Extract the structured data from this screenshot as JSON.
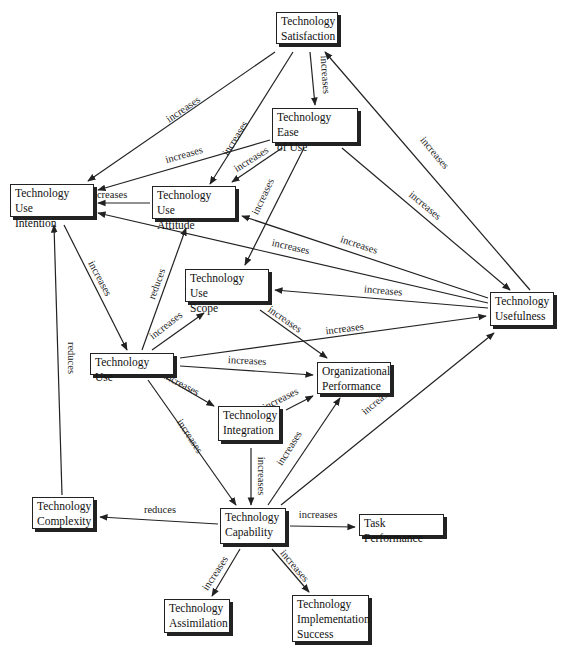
{
  "diagram": {
    "type": "concept-map",
    "nodes": [
      {
        "id": "satisfaction",
        "label": "Technology\nSatisfaction",
        "x": 276,
        "y": 12,
        "w": 62,
        "h": 32
      },
      {
        "id": "ease_of_use",
        "label": "Technology Ease\nof Use",
        "x": 272,
        "y": 108,
        "w": 86,
        "h": 35
      },
      {
        "id": "use_intention",
        "label": "Technology Use\nIntention",
        "x": 10,
        "y": 184,
        "w": 84,
        "h": 33
      },
      {
        "id": "use_attitude",
        "label": "Technology Use\nAttitude",
        "x": 152,
        "y": 186,
        "w": 84,
        "h": 33
      },
      {
        "id": "use_scope",
        "label": "Technology Use\nScope",
        "x": 185,
        "y": 269,
        "w": 84,
        "h": 33
      },
      {
        "id": "usefulness",
        "label": "Technology\nUsefulness",
        "x": 490,
        "y": 292,
        "w": 64,
        "h": 34
      },
      {
        "id": "tech_use",
        "label": "Technology Use",
        "x": 90,
        "y": 353,
        "w": 84,
        "h": 22
      },
      {
        "id": "org_performance",
        "label": "Organizational\nPerformance",
        "x": 317,
        "y": 362,
        "w": 74,
        "h": 32
      },
      {
        "id": "integration",
        "label": "Technology\nIntegration",
        "x": 218,
        "y": 406,
        "w": 62,
        "h": 35
      },
      {
        "id": "complexity",
        "label": "Technology\nComplexity",
        "x": 32,
        "y": 497,
        "w": 62,
        "h": 32
      },
      {
        "id": "capability",
        "label": "Technology\nCapability",
        "x": 220,
        "y": 508,
        "w": 66,
        "h": 36
      },
      {
        "id": "task_performance",
        "label": "Task Performance",
        "x": 359,
        "y": 514,
        "w": 85,
        "h": 22
      },
      {
        "id": "assimilation",
        "label": "Technology\nAssimilation",
        "x": 164,
        "y": 599,
        "w": 66,
        "h": 34
      },
      {
        "id": "impl_success",
        "label": "Technology\nImplementation\nSuccess",
        "x": 292,
        "y": 595,
        "w": 77,
        "h": 47
      }
    ],
    "edges": [
      {
        "from": "satisfaction",
        "to": "use_intention",
        "label": "increases",
        "x1": 275,
        "y1": 52,
        "x2": 88,
        "y2": 181,
        "lx": 185,
        "ly": 112,
        "rot": -34
      },
      {
        "from": "satisfaction",
        "to": "use_attitude",
        "label": "increases",
        "x1": 293,
        "y1": 52,
        "x2": 210,
        "y2": 184,
        "lx": 238,
        "ly": 140,
        "rot": -58
      },
      {
        "from": "satisfaction",
        "to": "ease_of_use",
        "label": "increases",
        "x1": 310,
        "y1": 52,
        "x2": 315,
        "y2": 105,
        "lx": 322,
        "ly": 75,
        "rot": 86
      },
      {
        "from": "usefulness",
        "to": "satisfaction",
        "label": "increases",
        "x1": 530,
        "y1": 290,
        "x2": 325,
        "y2": 52,
        "lx": 432,
        "ly": 155,
        "rot": 50
      },
      {
        "from": "ease_of_use",
        "to": "use_intention",
        "label": "increases",
        "x1": 270,
        "y1": 140,
        "x2": 98,
        "y2": 190,
        "lx": 185,
        "ly": 158,
        "rot": -16
      },
      {
        "from": "ease_of_use",
        "to": "use_attitude",
        "label": "increases",
        "x1": 282,
        "y1": 148,
        "x2": 232,
        "y2": 182,
        "lx": 253,
        "ly": 162,
        "rot": -32
      },
      {
        "from": "ease_of_use",
        "to": "use_scope",
        "label": "increases",
        "x1": 304,
        "y1": 148,
        "x2": 245,
        "y2": 265,
        "lx": 266,
        "ly": 198,
        "rot": -65
      },
      {
        "from": "ease_of_use",
        "to": "usefulness",
        "label": "increases",
        "x1": 342,
        "y1": 148,
        "x2": 510,
        "y2": 290,
        "lx": 423,
        "ly": 208,
        "rot": 40
      },
      {
        "from": "usefulness",
        "to": "use_attitude",
        "label": "increases",
        "x1": 488,
        "y1": 298,
        "x2": 242,
        "y2": 216,
        "lx": 358,
        "ly": 248,
        "rot": 18
      },
      {
        "from": "use_attitude",
        "to": "use_intention",
        "label": "increases",
        "x1": 150,
        "y1": 203,
        "x2": 98,
        "y2": 203,
        "lx": 108,
        "ly": 198,
        "rot": 0
      },
      {
        "from": "usefulness",
        "to": "use_intention",
        "label": "increases",
        "x1": 488,
        "y1": 303,
        "x2": 98,
        "y2": 213,
        "lx": 290,
        "ly": 250,
        "rot": 13
      },
      {
        "from": "usefulness",
        "to": "use_scope",
        "label": "increases",
        "x1": 488,
        "y1": 308,
        "x2": 275,
        "y2": 290,
        "lx": 383,
        "ly": 294,
        "rot": 5
      },
      {
        "from": "use_intention",
        "to": "tech_use",
        "label": "increases",
        "x1": 64,
        "y1": 225,
        "x2": 127,
        "y2": 350,
        "lx": 97,
        "ly": 280,
        "rot": 62
      },
      {
        "from": "tech_use",
        "to": "use_attitude",
        "label": "reduces",
        "x1": 142,
        "y1": 350,
        "x2": 186,
        "y2": 228,
        "lx": 160,
        "ly": 285,
        "rot": -70
      },
      {
        "from": "tech_use",
        "to": "use_scope",
        "label": "increases",
        "x1": 152,
        "y1": 350,
        "x2": 204,
        "y2": 313,
        "lx": 168,
        "ly": 328,
        "rot": -38
      },
      {
        "from": "tech_use",
        "to": "usefulness",
        "label": "increases",
        "x1": 180,
        "y1": 358,
        "x2": 486,
        "y2": 316,
        "lx": 345,
        "ly": 332,
        "rot": -7
      },
      {
        "from": "use_scope",
        "to": "org_performance",
        "label": "increases",
        "x1": 260,
        "y1": 310,
        "x2": 327,
        "y2": 358,
        "lx": 283,
        "ly": 322,
        "rot": 35
      },
      {
        "from": "tech_use",
        "to": "org_performance",
        "label": "increases",
        "x1": 180,
        "y1": 366,
        "x2": 313,
        "y2": 375,
        "lx": 247,
        "ly": 364,
        "rot": 3
      },
      {
        "from": "tech_use",
        "to": "integration",
        "label": "increases",
        "x1": 166,
        "y1": 378,
        "x2": 214,
        "y2": 406,
        "lx": 180,
        "ly": 387,
        "rot": 28
      },
      {
        "from": "integration",
        "to": "org_performance",
        "label": "increases",
        "x1": 286,
        "y1": 410,
        "x2": 313,
        "y2": 396,
        "lx": 282,
        "ly": 402,
        "rot": -27
      },
      {
        "from": "tech_use",
        "to": "capability",
        "label": "increases",
        "x1": 148,
        "y1": 380,
        "x2": 236,
        "y2": 505,
        "lx": 187,
        "ly": 438,
        "rot": 57
      },
      {
        "from": "integration",
        "to": "capability",
        "label": "increases",
        "x1": 251,
        "y1": 448,
        "x2": 251,
        "y2": 505,
        "lx": 258,
        "ly": 476,
        "rot": 90
      },
      {
        "from": "capability",
        "to": "org_performance",
        "label": "increases",
        "x1": 268,
        "y1": 505,
        "x2": 340,
        "y2": 398,
        "lx": 292,
        "ly": 450,
        "rot": -58
      },
      {
        "from": "capability",
        "to": "usefulness",
        "label": "increases",
        "x1": 281,
        "y1": 505,
        "x2": 494,
        "y2": 333,
        "lx": 380,
        "ly": 403,
        "rot": -40
      },
      {
        "from": "capability",
        "to": "complexity",
        "label": "reduces",
        "x1": 218,
        "y1": 524,
        "x2": 100,
        "y2": 517,
        "lx": 160,
        "ly": 513,
        "rot": 0
      },
      {
        "from": "complexity",
        "to": "use_intention",
        "label": "reduces",
        "x1": 62,
        "y1": 495,
        "x2": 54,
        "y2": 225,
        "lx": 68,
        "ly": 358,
        "rot": 90
      },
      {
        "from": "capability",
        "to": "task_performance",
        "label": "increases",
        "x1": 290,
        "y1": 526,
        "x2": 355,
        "y2": 527,
        "lx": 318,
        "ly": 518,
        "rot": 0
      },
      {
        "from": "capability",
        "to": "assimilation",
        "label": "increases",
        "x1": 240,
        "y1": 549,
        "x2": 212,
        "y2": 596,
        "lx": 218,
        "ly": 575,
        "rot": -57
      },
      {
        "from": "capability",
        "to": "impl_success",
        "label": "increases",
        "x1": 272,
        "y1": 549,
        "x2": 309,
        "y2": 592,
        "lx": 292,
        "ly": 568,
        "rot": 50
      }
    ]
  },
  "colors": {
    "line": "#222222",
    "box_border": "#222222",
    "box_shadow": "#222222",
    "background": "#ffffff"
  }
}
